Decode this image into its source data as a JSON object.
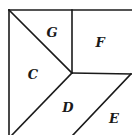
{
  "diagram": {
    "type": "dissection-figure",
    "regions": [
      {
        "id": "G",
        "label": "G"
      },
      {
        "id": "F",
        "label": "F"
      },
      {
        "id": "C",
        "label": "C"
      },
      {
        "id": "D",
        "label": "D"
      },
      {
        "id": "E",
        "label": "E"
      }
    ],
    "colors": {
      "line": "#1a1a1a",
      "background": "#ffffff"
    }
  }
}
